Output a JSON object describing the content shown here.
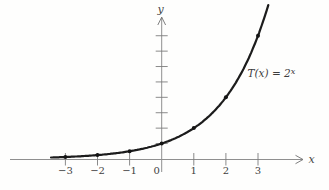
{
  "figure": {
    "background": "#fefefd",
    "curve_color": "#1c1c1c",
    "axis_color": "#8f8f8f",
    "text_color": "#3c3c3c"
  },
  "chart_data": {
    "type": "line",
    "function": "T(x) = 2^x",
    "function_label": {
      "base": "T(x) = 2",
      "superscript": "x"
    },
    "xlabel": "x",
    "ylabel": "y",
    "origin_label": "0",
    "x_domain": [
      -3.45,
      3.32
    ],
    "ylim": [
      0,
      10
    ],
    "grid": false,
    "x_ticks": [
      {
        "value": -3,
        "label": "−3"
      },
      {
        "value": -2,
        "label": "−2"
      },
      {
        "value": -1,
        "label": "−1"
      },
      {
        "value": 1,
        "label": "1"
      },
      {
        "value": 2,
        "label": "2"
      },
      {
        "value": 3,
        "label": "3"
      }
    ],
    "y_tick_values": [
      1,
      2,
      3,
      4,
      5,
      6,
      7,
      8
    ],
    "y_ticks_labeled": false,
    "points": [
      {
        "x": -3,
        "y": 0.125
      },
      {
        "x": -2,
        "y": 0.25
      },
      {
        "x": -1,
        "y": 0.5
      },
      {
        "x": 0,
        "y": 1
      },
      {
        "x": 1,
        "y": 2
      },
      {
        "x": 2,
        "y": 4
      },
      {
        "x": 3,
        "y": 8
      }
    ]
  }
}
